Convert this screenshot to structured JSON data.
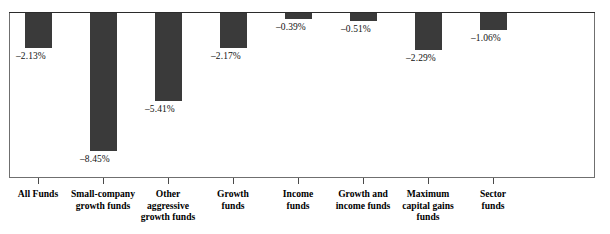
{
  "chart_data": {
    "type": "bar",
    "title": "",
    "subtitle": "",
    "xlabel": "",
    "ylabel": "",
    "orientation": "vertical",
    "grid": false,
    "legend": false,
    "units": "percent",
    "zero_line": 0,
    "ylim": [
      -9.0,
      0
    ],
    "categories": [
      "All Funds",
      "Small-company growth funds",
      "Other aggressive growth funds",
      "Growth funds",
      "Income funds",
      "Growth and income funds",
      "Maximum capital gains funds",
      "Sector funds"
    ],
    "category_lines": [
      [
        "All Funds"
      ],
      [
        "Small-company",
        "growth funds"
      ],
      [
        "Other",
        "aggressive",
        "growth funds"
      ],
      [
        "Growth",
        "funds"
      ],
      [
        "Income",
        "funds"
      ],
      [
        "Growth and",
        "income funds"
      ],
      [
        "Maximum",
        "capital gains",
        "funds"
      ],
      [
        "Sector",
        "funds"
      ]
    ],
    "values": [
      -2.13,
      -8.45,
      -5.41,
      -2.17,
      -0.39,
      -0.51,
      -2.29,
      -1.06
    ],
    "value_labels": [
      "–2.13%",
      "–8.45%",
      "–5.41%",
      "–2.17%",
      "–0.39%",
      "–0.51%",
      "–2.29%",
      "–1.06%"
    ],
    "bar_color": "#3a3a3a",
    "axis_color": "#2b2b2b"
  }
}
